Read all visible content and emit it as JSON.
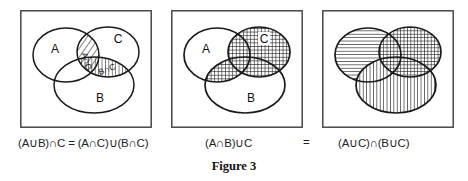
{
  "figure": {
    "label": "Figure 3",
    "background_color": "#ffffff",
    "stroke_color": "#1a1a1a"
  },
  "equals_between_panels": "=",
  "panels": [
    {
      "id": "panel-1",
      "caption": "(A∪B)∩C = (A∩C)∪(B∩C)",
      "set_labels": [
        "A",
        "B",
        "C"
      ],
      "region_labels": [
        "A∩C",
        "B∩C"
      ],
      "shaded_regions": [
        "A∩C",
        "B∩C"
      ],
      "fill_patterns": [
        "diagonal-hatch",
        "vertical-hatch"
      ]
    },
    {
      "id": "panel-2",
      "caption": "(A∩B)∪C",
      "set_labels": [
        "A",
        "B",
        "C"
      ],
      "region_labels": [],
      "shaded_regions": [
        "C",
        "A∩B"
      ],
      "fill_patterns": [
        "cross-hatch"
      ]
    },
    {
      "id": "panel-3",
      "caption": "(A∪C)∩(B∪C)",
      "set_labels": [],
      "region_labels": [],
      "shaded_regions": [
        "A",
        "B",
        "C"
      ],
      "fill_patterns": [
        "horizontal-lines",
        "vertical-lines",
        "cross-hatch"
      ]
    }
  ]
}
